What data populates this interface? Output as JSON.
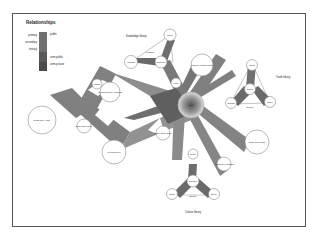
{
  "title": "Relationships",
  "legend": {
    "left_labels": [
      "primary",
      "secondary",
      "tertiary"
    ],
    "right_labels": [
      "public",
      "semi-public",
      "semi-private"
    ],
    "colors": [
      "#6e6e6e",
      "#808080",
      "#595959",
      "#4a4a4a"
    ]
  },
  "clusters": {
    "knowledge": {
      "label": "Knowledge library",
      "edge_label": "reading",
      "nodes": [
        "Reading",
        "Theory",
        "Reference"
      ]
    },
    "youth": {
      "label": "Youth library",
      "edge_label": "Gallery",
      "nodes": [
        "Gallery",
        "Studio",
        "Reading",
        "Theory"
      ]
    },
    "culture": {
      "label": "Culture library",
      "edge_label": "Gallery",
      "nodes": [
        "Exhibition",
        "Studio",
        "Theory",
        "Depot"
      ]
    }
  },
  "nodes": {
    "center": "Foyer",
    "news_cafe": "News café / Café",
    "book_return": "Book return library",
    "technical": "Technical space / Logistics",
    "logistics": "Logistics",
    "training": "Training / Multiple design",
    "study": "Study / study space",
    "meeting": "Meeting area",
    "lobby": "Lobby",
    "depot": "Depot",
    "auditorium": "Auditorium / Workshop",
    "children": "Child area public"
  }
}
